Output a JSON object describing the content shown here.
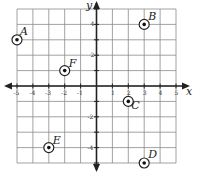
{
  "diagram": {
    "type": "coordinate-plane",
    "x_range": [
      -5,
      5
    ],
    "y_range": [
      -5,
      5
    ],
    "axis_labels": {
      "x": "x",
      "y": "y"
    },
    "x_tick_labels": [
      "-5",
      "-4",
      "-3",
      "-2",
      "-1",
      "1",
      "2",
      "3",
      "4",
      "5"
    ],
    "y_tick_labels": [
      "4",
      "2",
      "-2",
      "-4"
    ],
    "points": [
      {
        "label": "A",
        "x": -5,
        "y": 3
      },
      {
        "label": "B",
        "x": 3,
        "y": 4
      },
      {
        "label": "C",
        "x": 2,
        "y": -1
      },
      {
        "label": "D",
        "x": 3,
        "y": -5
      },
      {
        "label": "E",
        "x": -3,
        "y": -4
      },
      {
        "label": "F",
        "x": -2,
        "y": 1
      }
    ]
  }
}
